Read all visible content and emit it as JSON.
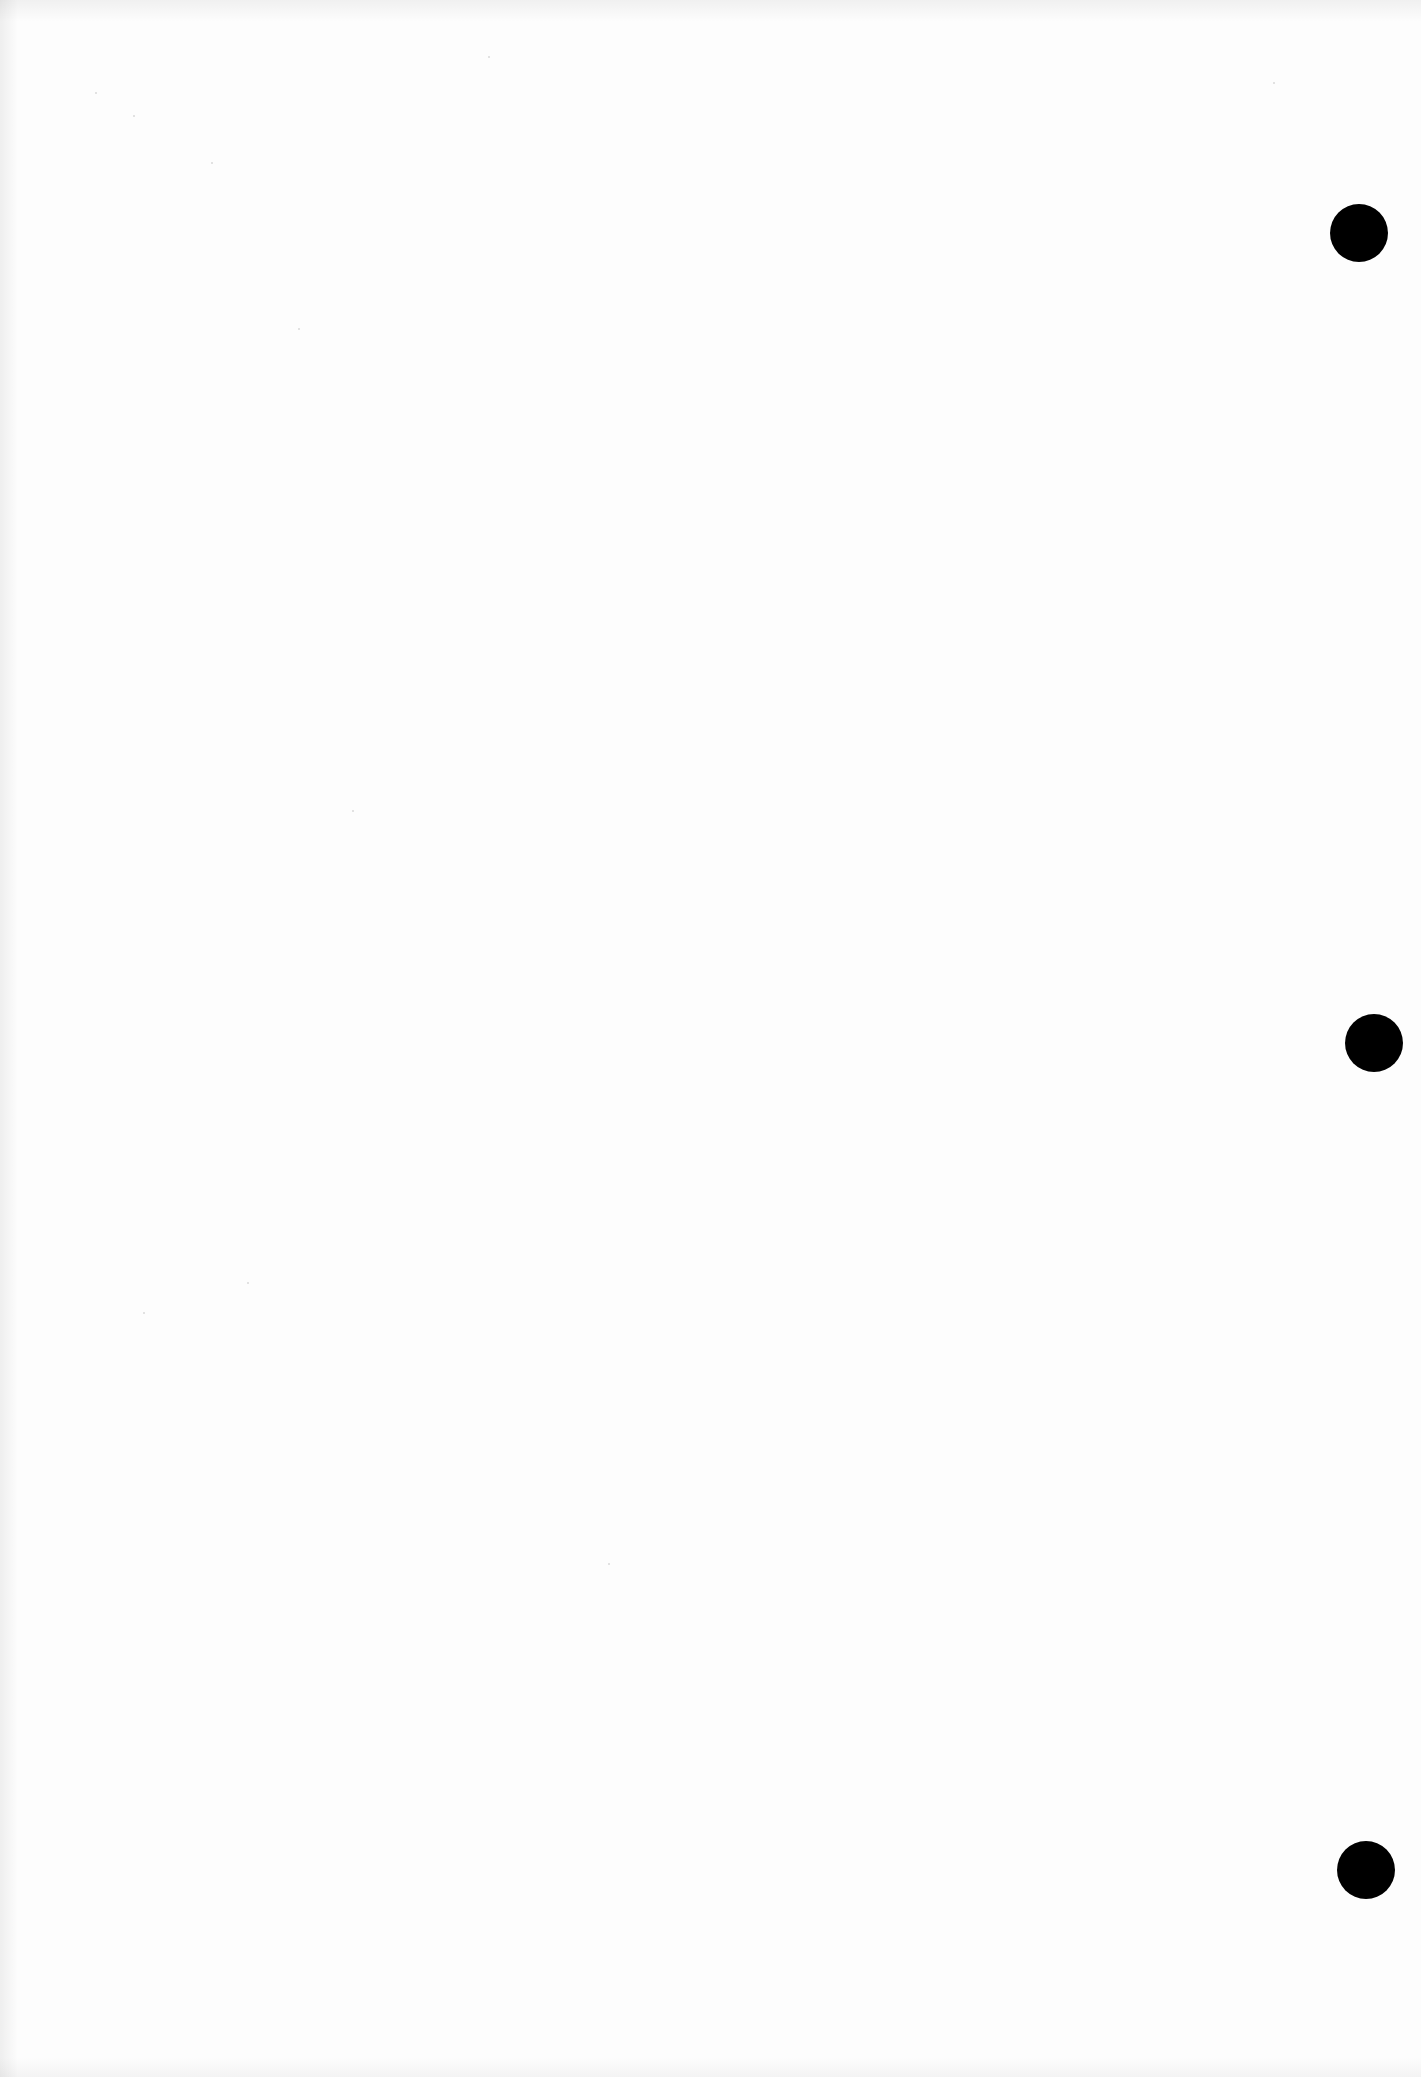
{
  "document": {
    "type": "blank scanned page",
    "background_color": "#fdfdfd",
    "text": ""
  },
  "punch_holes": [
    {
      "name": "top",
      "cx": 1359,
      "cy": 233,
      "diameter": 58,
      "color": "#000000"
    },
    {
      "name": "middle",
      "cx": 1374,
      "cy": 1043,
      "diameter": 58,
      "color": "#000000"
    },
    {
      "name": "bottom",
      "cx": 1366,
      "cy": 1870,
      "diameter": 58,
      "color": "#000000"
    }
  ]
}
